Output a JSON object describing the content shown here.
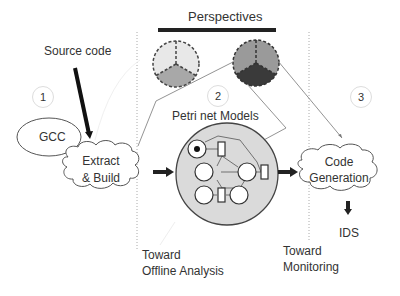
{
  "diagram": {
    "title": "Perspectives",
    "source_label": "Source code",
    "steps": [
      {
        "number": "1"
      },
      {
        "number": "2",
        "title": "Petri net Models"
      },
      {
        "number": "3"
      }
    ],
    "nodes": {
      "gcc": "GCC",
      "extract_line1": "Extract",
      "extract_line2": "& Build",
      "codegen_line1": "Code",
      "codegen_line2": "Generation",
      "ids": "IDS"
    },
    "annotations": {
      "offline_line1": "Toward",
      "offline_line2": "Offline Analysis",
      "monitoring_line1": "Toward",
      "monitoring_line2": "Monitoring"
    },
    "colors": {
      "light_slice": "#e6e6e6",
      "mid_slice": "#a9a9a9",
      "dark_slice": "#3c3c3c",
      "petri_bg": "#d9d9d9",
      "arrow": "#1a1a1a"
    }
  }
}
